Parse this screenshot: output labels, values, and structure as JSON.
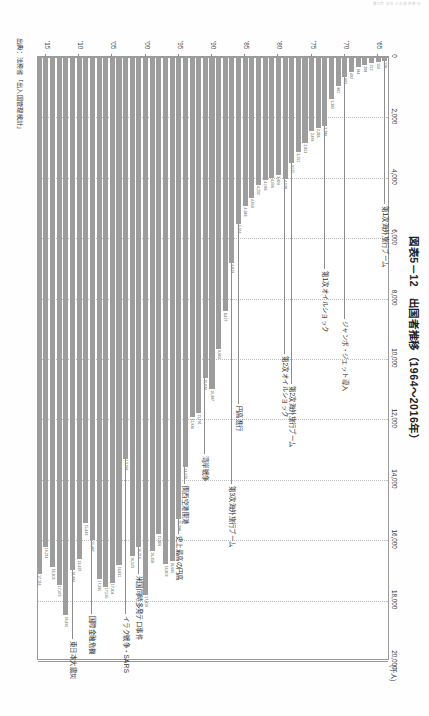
{
  "running_head": "第5章 日本人の海外旅行",
  "title": "図表5－12　出国者推移（1964～2016年）",
  "source": "出典：法務省「出入国管理統計」",
  "unit_label": "(千人)",
  "axis": {
    "value_ticks": [
      "0",
      "2,000",
      "4,000",
      "6,000",
      "8,000",
      "10,000",
      "12,000",
      "14,000",
      "16,000",
      "18,000",
      "20,000"
    ],
    "value_min": 0,
    "value_max": 20000,
    "year_ticks": [
      "'65",
      "'70",
      "'75",
      "'80",
      "'85",
      "'90",
      "'95",
      "'00",
      "'05",
      "'10",
      "'15"
    ]
  },
  "annotations": [
    {
      "label": "第1次海外旅行ブーム",
      "year": 1964
    },
    {
      "label": "ジャンボ・ジェット導入",
      "year": 1970
    },
    {
      "label": "第1次オイルショック",
      "year": 1973
    },
    {
      "label": "第2次海外旅行ブーム",
      "year": 1978
    },
    {
      "label": "第2次オイルショック",
      "year": 1979
    },
    {
      "label": "円高進行",
      "year": 1986
    },
    {
      "label": "第3次海外旅行ブーム",
      "year": 1987
    },
    {
      "label": "湾岸戦争",
      "year": 1991
    },
    {
      "label": "関西空港開港",
      "year": 1994
    },
    {
      "label": "史上最高の円高",
      "year": 1995
    },
    {
      "label": "米国同時多発テロ事件",
      "year": 2001
    },
    {
      "label": "イラク戦争・SARS",
      "year": 2003
    },
    {
      "label": "国際金融危機",
      "year": 2008
    },
    {
      "label": "東日本大震災",
      "year": 2011
    }
  ],
  "chart_data": {
    "type": "bar",
    "title": "図表5－12　出国者推移（1964～2016年）",
    "xlabel": "(千人)",
    "ylabel": "",
    "orientation": "horizontal",
    "xlim": [
      0,
      20000
    ],
    "grid": true,
    "legend": "none",
    "unit": "千人",
    "categories": [
      "1964",
      "1965",
      "1966",
      "1967",
      "1968",
      "1969",
      "1970",
      "1971",
      "1972",
      "1973",
      "1974",
      "1975",
      "1976",
      "1977",
      "1978",
      "1979",
      "1980",
      "1981",
      "1982",
      "1983",
      "1984",
      "1985",
      "1986",
      "1987",
      "1988",
      "1989",
      "1990",
      "1991",
      "1992",
      "1993",
      "1994",
      "1995",
      "1996",
      "1997",
      "1998",
      "1999",
      "2000",
      "2001",
      "2002",
      "2003",
      "2004",
      "2005",
      "2006",
      "2007",
      "2008",
      "2009",
      "2010",
      "2011",
      "2012",
      "2013",
      "2014",
      "2015",
      "2016"
    ],
    "values": [
      128,
      159,
      212,
      268,
      344,
      492,
      663,
      961,
      1392,
      2289,
      2336,
      2466,
      2853,
      3151,
      3525,
      4038,
      3909,
      4006,
      4086,
      4232,
      4659,
      4948,
      5516,
      6829,
      8427,
      9663,
      10997,
      10634,
      11791,
      11934,
      13579,
      15298,
      16695,
      16803,
      15806,
      16358,
      17819,
      16216,
      16523,
      13296,
      16831,
      17404,
      17535,
      17295,
      15987,
      15446,
      16637,
      16994,
      18491,
      17473,
      16903,
      16214,
      17116
    ],
    "data_labels": [
      "128",
      "159",
      "212",
      "268",
      "344",
      "492",
      "663",
      "961",
      "1,392",
      "2,289",
      "2,336",
      "2,466",
      "2,853",
      "3,151",
      "3,525",
      "4,038",
      "3,909",
      "4,006",
      "4,086",
      "4,232",
      "4,659",
      "4,948",
      "5,516",
      "6,829",
      "8,427",
      "9,663",
      "10,997",
      "10,634",
      "11,791",
      "11,934",
      "13,579",
      "15,298",
      "16,695",
      "16,803",
      "15,806",
      "16,358",
      "17,819",
      "16,216",
      "16,523",
      "13,296",
      "16,831",
      "17,404",
      "17,535",
      "17,295",
      "15,987",
      "15,446",
      "16,637",
      "16,994",
      "18,491",
      "17,473",
      "16,903",
      "16,214",
      "17,116"
    ]
  },
  "colors": {
    "bar": "#9d9d9d",
    "grid": "#bdbdbd",
    "frame": "#9a9a9a",
    "text": "#333333"
  }
}
